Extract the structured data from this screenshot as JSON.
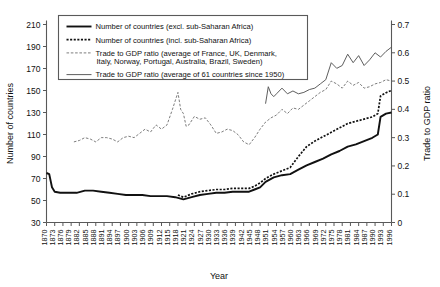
{
  "chart_data": {
    "type": "line",
    "title": "",
    "xlabel": "Year",
    "ylabel": "Number of countries",
    "y2label": "Trade to GDP ratio",
    "ylim": [
      30,
      210
    ],
    "y2lim": [
      0,
      0.7
    ],
    "xlim": [
      1870,
      1996
    ],
    "grid": false,
    "legend_position": "top-left",
    "yticks": [
      30,
      50,
      70,
      90,
      110,
      130,
      150,
      170,
      190,
      210
    ],
    "y2ticks": [
      "0",
      "0.1",
      "0.2",
      "0.3",
      "0.4",
      "0.5",
      "0.6",
      "0.7"
    ],
    "xticks": [
      1870,
      1873,
      1876,
      1879,
      1882,
      1885,
      1888,
      1891,
      1894,
      1897,
      1900,
      1903,
      1906,
      1909,
      1912,
      1915,
      1918,
      1921,
      1924,
      1927,
      1930,
      1933,
      1936,
      1939,
      1942,
      1945,
      1948,
      1951,
      1954,
      1957,
      1960,
      1963,
      1966,
      1969,
      1972,
      1975,
      1978,
      1981,
      1984,
      1987,
      1990,
      1993,
      1996
    ],
    "series": [
      {
        "name": "Number of countries (excl. sub-Saharan Africa)",
        "axis": "left",
        "style": "solid-bold",
        "color": "#111111",
        "x": [
          1870,
          1871,
          1872,
          1873,
          1875,
          1878,
          1881,
          1884,
          1887,
          1890,
          1893,
          1896,
          1899,
          1902,
          1905,
          1908,
          1911,
          1914,
          1917,
          1920,
          1923,
          1926,
          1929,
          1932,
          1935,
          1938,
          1941,
          1944,
          1946,
          1948,
          1950,
          1953,
          1956,
          1959,
          1962,
          1965,
          1968,
          1971,
          1974,
          1977,
          1980,
          1983,
          1986,
          1989,
          1991,
          1992,
          1994,
          1996
        ],
        "values": [
          75,
          74,
          62,
          58,
          57,
          57,
          57,
          59,
          59,
          58,
          57,
          56,
          55,
          55,
          55,
          54,
          54,
          54,
          53,
          51,
          53,
          55,
          56,
          57,
          57,
          58,
          58,
          58,
          60,
          62,
          67,
          71,
          73,
          74,
          78,
          82,
          85,
          88,
          92,
          95,
          99,
          101,
          104,
          107,
          110,
          126,
          129,
          130
        ]
      },
      {
        "name": "Number of countries (incl. sub-Saharan Africa)",
        "axis": "left",
        "style": "dotted-bold",
        "color": "#111111",
        "x": [
          1918,
          1920,
          1923,
          1926,
          1929,
          1932,
          1935,
          1938,
          1941,
          1944,
          1946,
          1948,
          1950,
          1953,
          1956,
          1959,
          1962,
          1965,
          1968,
          1971,
          1974,
          1977,
          1980,
          1983,
          1986,
          1989,
          1991,
          1992,
          1994,
          1996
        ],
        "values": [
          55,
          53,
          56,
          58,
          59,
          60,
          60,
          61,
          61,
          61,
          63,
          66,
          70,
          74,
          77,
          80,
          90,
          99,
          104,
          108,
          112,
          116,
          120,
          122,
          124,
          126,
          129,
          145,
          148,
          150
        ]
      },
      {
        "name": "Trade to GDP ratio (average of France, UK, Denmark, Italy, Norway, Portugal, Australia, Brazil, Sweden)",
        "axis": "right",
        "style": "dashed-thin",
        "color": "#666666",
        "x": [
          1880,
          1882,
          1884,
          1886,
          1888,
          1890,
          1892,
          1894,
          1896,
          1898,
          1900,
          1902,
          1904,
          1906,
          1908,
          1910,
          1912,
          1914,
          1916,
          1918,
          1919,
          1920,
          1921,
          1922,
          1924,
          1926,
          1928,
          1930,
          1932,
          1934,
          1936,
          1938,
          1940,
          1942,
          1944,
          1946,
          1948,
          1950,
          1952,
          1954,
          1956,
          1958,
          1960,
          1962,
          1964,
          1966,
          1968,
          1970,
          1972,
          1974,
          1976,
          1978,
          1980,
          1982,
          1984,
          1986,
          1988,
          1990,
          1992,
          1994,
          1996
        ],
        "values": [
          0.285,
          0.29,
          0.3,
          0.295,
          0.285,
          0.3,
          0.3,
          0.295,
          0.285,
          0.3,
          0.305,
          0.3,
          0.315,
          0.33,
          0.32,
          0.345,
          0.33,
          0.345,
          0.4,
          0.46,
          0.4,
          0.385,
          0.34,
          0.345,
          0.375,
          0.365,
          0.37,
          0.345,
          0.315,
          0.32,
          0.33,
          0.325,
          0.31,
          0.285,
          0.275,
          0.3,
          0.33,
          0.355,
          0.37,
          0.38,
          0.4,
          0.385,
          0.405,
          0.4,
          0.415,
          0.43,
          0.445,
          0.46,
          0.47,
          0.5,
          0.49,
          0.475,
          0.5,
          0.485,
          0.495,
          0.475,
          0.48,
          0.49,
          0.495,
          0.505,
          0.5
        ]
      },
      {
        "name": "Trade to GDP ratio (average of 61 countries since 1950)",
        "axis": "right",
        "style": "solid-thin",
        "color": "#555555",
        "x": [
          1950,
          1951,
          1952,
          1953,
          1954,
          1956,
          1958,
          1960,
          1962,
          1964,
          1966,
          1968,
          1970,
          1972,
          1974,
          1976,
          1978,
          1980,
          1982,
          1984,
          1986,
          1988,
          1990,
          1992,
          1994,
          1996
        ],
        "values": [
          0.42,
          0.48,
          0.455,
          0.445,
          0.455,
          0.475,
          0.455,
          0.465,
          0.455,
          0.46,
          0.47,
          0.475,
          0.49,
          0.505,
          0.565,
          0.545,
          0.555,
          0.595,
          0.565,
          0.59,
          0.555,
          0.575,
          0.6,
          0.585,
          0.605,
          0.62
        ]
      }
    ]
  },
  "axes": {
    "left_title": "Number of countries",
    "right_title": "Trade to GDP ratio",
    "bottom_title": "Year"
  },
  "legend": {
    "entries": [
      {
        "label": "Number of countries (excl. sub-Saharan Africa)",
        "swatch": "solid-bold"
      },
      {
        "label": "Number of countries (incl. sub-Saharan Africa)",
        "swatch": "dotted-bold"
      },
      {
        "label": "Trade  to GDP ratio (average of France, UK, Denmark,",
        "swatch": "dashed-thin"
      },
      {
        "label": "Italy, Norway, Portugal, Australia, Brazil, Sweden)",
        "swatch": "none"
      },
      {
        "label": "Trade to GDP ratio (average of 61 countries since 1950)",
        "swatch": "solid-thin"
      }
    ]
  }
}
